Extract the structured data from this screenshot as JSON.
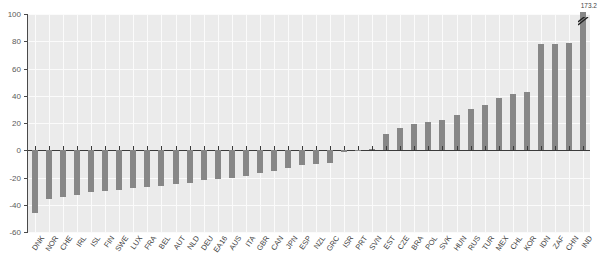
{
  "chart_data": {
    "type": "bar",
    "title": "",
    "subtitle": "",
    "xlabel": "",
    "ylabel": "",
    "ylim": [
      -60,
      100
    ],
    "yticks": [
      100,
      80,
      60,
      40,
      20,
      0,
      -20,
      -40,
      -60
    ],
    "grid": true,
    "legend": null,
    "orientation": "vertical",
    "bar_color": "#878787",
    "plot_background": "#ebebeb",
    "gridline_color": "#fbfbfb",
    "axis_color": "#3a3a3a",
    "categories": [
      "DNK",
      "NOR",
      "CHE",
      "IRL",
      "ISL",
      "FIN",
      "SWE",
      "LUX",
      "FRA",
      "BEL",
      "AUT",
      "NLD",
      "DEU",
      "EA16",
      "AUS",
      "ITA",
      "GBR",
      "CAN",
      "JPN",
      "ESP",
      "NZL",
      "GRC",
      "ISR",
      "PRT",
      "SVN",
      "EST",
      "CZE",
      "BRA",
      "POL",
      "SVK",
      "HUN",
      "RUS",
      "TUR",
      "MEX",
      "CHL",
      "KOR",
      "IDN",
      "ZAF",
      "CHN",
      "IND"
    ],
    "values": [
      -46,
      -36,
      -34,
      -33,
      -31,
      -30,
      -29,
      -28,
      -27,
      -26,
      -25,
      -24,
      -22,
      -21,
      -20,
      -19,
      -17,
      -15,
      -13,
      -11,
      -10,
      -9,
      -1,
      0.5,
      1,
      12,
      16,
      19,
      21,
      22,
      26,
      30,
      33,
      38,
      41,
      43,
      78,
      78,
      79,
      173.2
    ],
    "annotations": [
      {
        "category": "IND",
        "label": "173.2",
        "note": "bar truncated by axis break at top of plot"
      }
    ]
  }
}
